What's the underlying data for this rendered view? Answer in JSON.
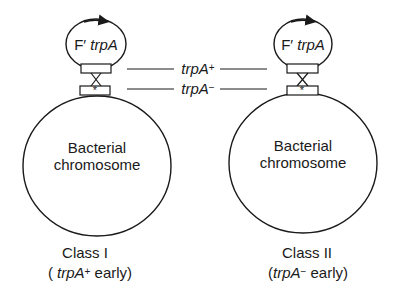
{
  "diagram": {
    "left": {
      "plasmid_label_prefix": "F′ ",
      "plasmid_label_gene": "trpA",
      "chromosome_line1": "Bacterial",
      "chromosome_line2": "chromosome",
      "marker": "*",
      "class_label": "Class I",
      "class_desc_open": "( ",
      "class_desc_gene": "trpA",
      "class_desc_sup": "+",
      "class_desc_rest": " early)"
    },
    "right": {
      "plasmid_label_prefix": "F′ ",
      "plasmid_label_gene": "trpA",
      "chromosome_line1": "Bacterial",
      "chromosome_line2": "chromosome",
      "marker": "*",
      "class_label": "Class II",
      "class_desc_open": "(",
      "class_desc_gene": "trpA",
      "class_desc_sup": "−",
      "class_desc_rest": " early)"
    },
    "center_labels": {
      "upper_gene": "trpA",
      "upper_sup": "+",
      "lower_gene": "trpA",
      "lower_sup": "−"
    },
    "colors": {
      "stroke": "#1a1a1a",
      "background": "#ffffff"
    }
  }
}
